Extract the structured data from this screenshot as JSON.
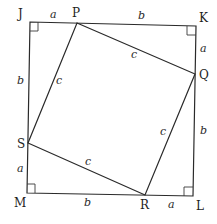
{
  "diagram": {
    "vertices": {
      "J": {
        "label": "J",
        "x": 30,
        "y": 22
      },
      "K": {
        "label": "K",
        "x": 196,
        "y": 26
      },
      "L": {
        "label": "L",
        "x": 193,
        "y": 196
      },
      "M": {
        "label": "M",
        "x": 27,
        "y": 193
      },
      "P": {
        "label": "P",
        "x": 77,
        "y": 23
      },
      "Q": {
        "label": "Q",
        "x": 195,
        "y": 74
      },
      "R": {
        "label": "R",
        "x": 145,
        "y": 195
      },
      "S": {
        "label": "S",
        "x": 28,
        "y": 143
      }
    },
    "side_labels": {
      "JP": "a",
      "PK": "b",
      "KQ": "a",
      "QL": "b",
      "LR": "a",
      "RM": "b",
      "MS": "a",
      "SJ": "b",
      "PQ": "c",
      "QR": "c",
      "RS": "c",
      "SP": "c"
    },
    "right_angle_markers": [
      "J",
      "K",
      "L",
      "M"
    ],
    "colors": {
      "line": "#2a2a2a",
      "text": "#1e1e1e",
      "background": "#ffffff"
    }
  }
}
